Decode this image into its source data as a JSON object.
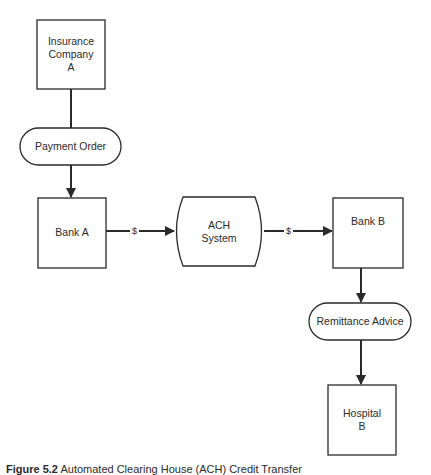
{
  "diagram": {
    "nodes": [
      {
        "id": "insurance-company-a",
        "shape": "rectangle",
        "lines": [
          "Insurance",
          "Company",
          "A"
        ]
      },
      {
        "id": "payment-order",
        "shape": "pill",
        "lines": [
          "Payment Order"
        ]
      },
      {
        "id": "bank-a",
        "shape": "rectangle",
        "lines": [
          "Bank A"
        ]
      },
      {
        "id": "ach-system",
        "shape": "barrel",
        "lines": [
          "ACH",
          "System"
        ]
      },
      {
        "id": "bank-b",
        "shape": "rectangle",
        "lines": [
          "Bank B"
        ]
      },
      {
        "id": "remittance-advice",
        "shape": "pill",
        "lines": [
          "Remittance Advice"
        ]
      },
      {
        "id": "hospital-b",
        "shape": "rectangle",
        "lines": [
          "Hospital",
          "B"
        ]
      }
    ],
    "edges": [
      {
        "from": "insurance-company-a",
        "to": "payment-order",
        "label": "",
        "arrow": false
      },
      {
        "from": "payment-order",
        "to": "bank-a",
        "label": "",
        "arrow": true
      },
      {
        "from": "bank-a",
        "to": "ach-system",
        "label": "$",
        "arrow": true
      },
      {
        "from": "ach-system",
        "to": "bank-b",
        "label": "$",
        "arrow": true
      },
      {
        "from": "bank-b",
        "to": "remittance-advice",
        "label": "",
        "arrow": true
      },
      {
        "from": "remittance-advice",
        "to": "hospital-b",
        "label": "",
        "arrow": true
      }
    ]
  },
  "caption": {
    "figure_number": "Figure 5.2",
    "text": "Automated Clearing House (ACH) Credit Transfer"
  },
  "colors": {
    "stroke": "#2a2a2a",
    "background": "#ffffff"
  }
}
